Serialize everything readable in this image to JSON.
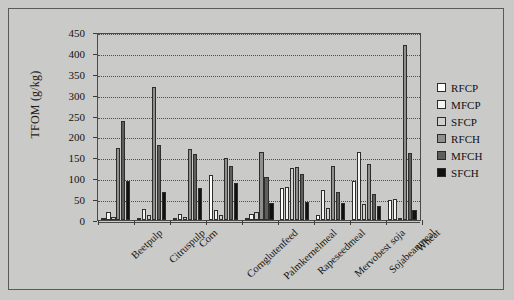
{
  "chart_data": {
    "type": "bar",
    "title": "",
    "xlabel": "",
    "ylabel": "TFOM (g/kg)",
    "ylim": [
      0,
      450
    ],
    "yticks": [
      0,
      50,
      100,
      150,
      200,
      250,
      300,
      350,
      400,
      450
    ],
    "grid": true,
    "legend_position": "right",
    "categories": [
      "Beetpulp",
      "Citruspulp",
      "Corn",
      "Cornglutenfeed",
      "Palmkernelmeal",
      "Rapeseedmeal",
      "Mervobest soja",
      "Sojabeanmeal",
      "Wheat"
    ],
    "series": [
      {
        "name": "RFCP",
        "color": "#ffffff",
        "values": [
          5,
          3,
          4,
          108,
          6,
          77,
          12,
          93,
          48
        ]
      },
      {
        "name": "MFCP",
        "color": "#f4f4f2",
        "values": [
          18,
          26,
          14,
          25,
          14,
          80,
          73,
          163,
          50
        ]
      },
      {
        "name": "SFCP",
        "color": "#d0d0ce",
        "values": [
          8,
          11,
          8,
          12,
          20,
          125,
          28,
          38,
          4
        ]
      },
      {
        "name": "RFCH",
        "color": "#8f8f8d",
        "values": [
          172,
          318,
          170,
          148,
          163,
          127,
          130,
          134,
          418
        ]
      },
      {
        "name": "MFCH",
        "color": "#5e5e5c",
        "values": [
          237,
          180,
          158,
          130,
          103,
          110,
          68,
          62,
          160
        ]
      },
      {
        "name": "SFCH",
        "color": "#111111",
        "values": [
          93,
          66,
          77,
          88,
          40,
          42,
          40,
          33,
          25
        ]
      }
    ]
  },
  "legend": {
    "items": [
      {
        "label": "RFCP",
        "color": "#ffffff"
      },
      {
        "label": "MFCP",
        "color": "#f4f4f2"
      },
      {
        "label": "SFCP",
        "color": "#d0d0ce"
      },
      {
        "label": "RFCH",
        "color": "#8f8f8d"
      },
      {
        "label": "MFCH",
        "color": "#5e5e5c"
      },
      {
        "label": "SFCH",
        "color": "#111111"
      }
    ]
  }
}
